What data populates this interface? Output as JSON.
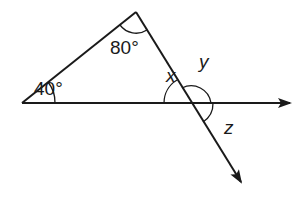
{
  "diagram": {
    "type": "geometry-angles",
    "colors": {
      "stroke": "#1a1a1a",
      "background": "#ffffff"
    },
    "points": {
      "left_vertex": [
        22,
        103
      ],
      "top_vertex": [
        136,
        12
      ],
      "intersection": [
        191,
        103
      ],
      "horizontal_arrow_tip": [
        290,
        103
      ],
      "diagonal_arrow_tip": [
        241,
        182
      ]
    },
    "labels": {
      "angle_left": "40°",
      "angle_top": "80°",
      "angle_x": "x",
      "angle_y": "y",
      "angle_z": "z"
    }
  }
}
